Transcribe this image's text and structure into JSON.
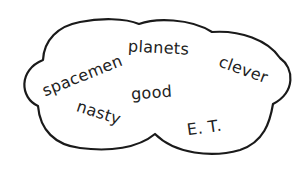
{
  "illustration": {
    "shape": "thought-cloud",
    "outline_color": "#1a1a1a",
    "fill_color": "#ffffff",
    "text_color": "#222222",
    "words": [
      {
        "id": "spacemen",
        "text": "spacemen",
        "cx": 82,
        "cy": 76,
        "rotate": -22
      },
      {
        "id": "planets",
        "text": "planets",
        "cx": 159,
        "cy": 48,
        "rotate": 3
      },
      {
        "id": "clever",
        "text": "clever",
        "cx": 243,
        "cy": 70,
        "rotate": 20
      },
      {
        "id": "good",
        "text": "good",
        "cx": 152,
        "cy": 93,
        "rotate": -4
      },
      {
        "id": "nasty",
        "text": "nasty",
        "cx": 99,
        "cy": 113,
        "rotate": 18
      },
      {
        "id": "et",
        "text": "E. T.",
        "cx": 204,
        "cy": 128,
        "rotate": -8
      }
    ]
  }
}
